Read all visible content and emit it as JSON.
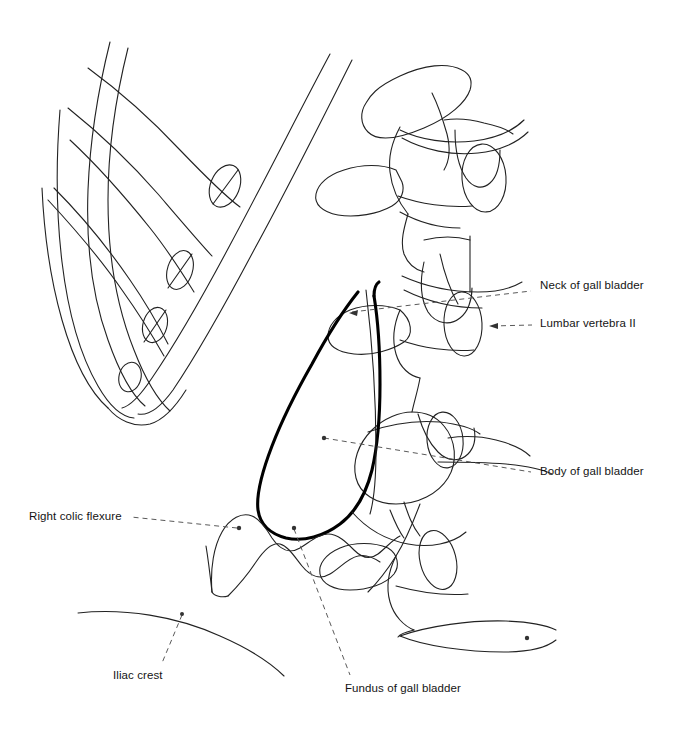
{
  "figure": {
    "type": "anatomical-line-drawing",
    "background_color": "#ffffff",
    "line_color": "#1a1a1a",
    "emphasis_color": "#000000",
    "leader_color": "#5a5a5a",
    "width": 673,
    "height": 734
  },
  "labels": [
    {
      "id": "neck-of-gall-bladder",
      "text": "Neck of gall bladder",
      "side": "right",
      "x": 540,
      "y": 286,
      "leader": {
        "x1": 349,
        "y1": 313,
        "x2": 531,
        "y2": 291
      },
      "marker": "arrow-left"
    },
    {
      "id": "lumbar-vertebra-ii",
      "text": "Lumbar vertebra II",
      "side": "right",
      "x": 540,
      "y": 320,
      "leader": {
        "x1": 489,
        "y1": 326,
        "x2": 532,
        "y2": 325
      },
      "marker": "arrow-left"
    },
    {
      "id": "body-of-gall-bladder",
      "text": "Body of gall bladder",
      "side": "right",
      "x": 540,
      "y": 468,
      "leader": {
        "x1": 324,
        "y1": 438,
        "x2": 531,
        "y2": 472
      },
      "marker": "dot"
    },
    {
      "id": "right-colic-flexure",
      "text": "Right colic flexure",
      "side": "left",
      "x": 29,
      "y": 511,
      "leader": {
        "x1": 239,
        "y1": 528,
        "x2": 131,
        "y2": 517
      },
      "marker": "dot"
    },
    {
      "id": "iliac-crest",
      "text": "Iliac crest",
      "side": "left",
      "x": 113,
      "y": 673,
      "leader": {
        "x1": 182,
        "y1": 614,
        "x2": 162,
        "y2": 663
      },
      "marker": "dot"
    },
    {
      "id": "fundus-of-gall-bladder",
      "text": "Fundus of gall bladder",
      "side": "left",
      "x": 345,
      "y": 685,
      "leader": {
        "x1": 294,
        "y1": 528,
        "x2": 350,
        "y2": 675
      },
      "marker": "dot"
    }
  ],
  "structures": [
    {
      "id": "costal-margin",
      "name": "Costal margin / costal cartilages"
    },
    {
      "id": "ribs",
      "name": "Lower ribs"
    },
    {
      "id": "costal-cartilage-ellipses",
      "name": "Costal cartilage cut ends",
      "count": 4
    },
    {
      "id": "lumbar-spine",
      "name": "Lumbar vertebral column"
    },
    {
      "id": "gall-bladder",
      "name": "Gall bladder outline"
    },
    {
      "id": "colon",
      "name": "Right colic flexure and colon"
    },
    {
      "id": "iliac-crest-arc",
      "name": "Iliac crest"
    }
  ]
}
